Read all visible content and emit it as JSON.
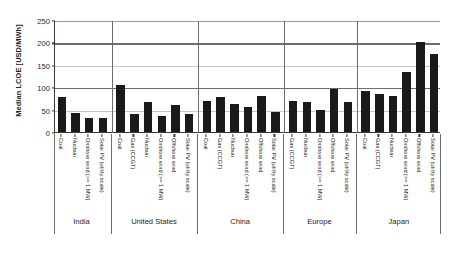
{
  "chart_data": {
    "type": "bar",
    "title": "",
    "xlabel": "",
    "ylabel": "Median LCOE [USD/MWh]",
    "ylim": [
      0,
      250
    ],
    "yticks": [
      0,
      50,
      100,
      150,
      200,
      250
    ],
    "grid": true,
    "legend": false,
    "legend_position": "none",
    "bar_color": "#1a1a1a",
    "groups": [
      {
        "name": "India",
        "categories": [
          "Coal",
          "Nuclear",
          "Onshore wind (>= 1 MW)",
          "Solar PV (utility scale)"
        ],
        "values": [
          78,
          43,
          32,
          32
        ]
      },
      {
        "name": "United States",
        "categories": [
          "Coal",
          "Gas (CCGT)",
          "Nuclear",
          "Onshore wind (>= 1 MW)",
          "Offshore wind",
          "Solar PV (utility scale)"
        ],
        "values": [
          105,
          40,
          66,
          35,
          60,
          40
        ]
      },
      {
        "name": "China",
        "categories": [
          "Coal",
          "Gas (CCGT)",
          "Nuclear",
          "Onshore wind (>= 1 MW)",
          "Offshore wind",
          "Solar PV (utility scale)"
        ],
        "values": [
          70,
          78,
          62,
          55,
          80,
          45
        ]
      },
      {
        "name": "Europe",
        "categories": [
          "Gas (CCGT)",
          "Nuclear",
          "Onshore wind (>= 1 MW)",
          "Offshore wind",
          "Solar PV (utility scale)"
        ],
        "values": [
          70,
          68,
          50,
          95,
          68
        ]
      },
      {
        "name": "Japan",
        "categories": [
          "Coal",
          "Gas (CCGT)",
          "Nuclear",
          "Onshore wind (>= 1 MW)",
          "Offshore wind",
          "Solar PV (utility scale)"
        ],
        "values": [
          92,
          85,
          80,
          135,
          200,
          175
        ]
      }
    ]
  }
}
